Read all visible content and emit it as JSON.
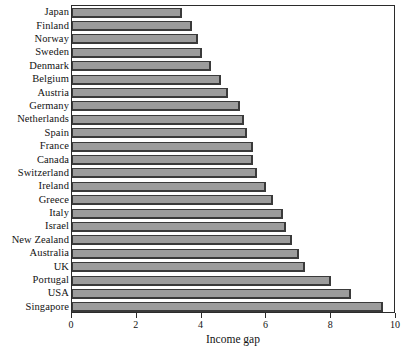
{
  "chart_data": {
    "type": "bar",
    "orientation": "horizontal",
    "title": "",
    "xlabel": "Income gap",
    "ylabel": "",
    "xlim": [
      0,
      10
    ],
    "ylim": null,
    "grid": false,
    "legend": null,
    "xticks": [
      0,
      2,
      4,
      6,
      8,
      10
    ],
    "xtick_labels": [
      "0",
      "2",
      "4",
      "6",
      "8",
      "10"
    ],
    "categories": [
      "Japan",
      "Finland",
      "Norway",
      "Sweden",
      "Denmark",
      "Belgium",
      "Austria",
      "Germany",
      "Netherlands",
      "Spain",
      "France",
      "Canada",
      "Switzerland",
      "Ireland",
      "Greece",
      "Italy",
      "Israel",
      "New Zealand",
      "Australia",
      "UK",
      "Portugal",
      "USA",
      "Singapore"
    ],
    "values": [
      3.4,
      3.7,
      3.9,
      4.0,
      4.3,
      4.6,
      4.8,
      5.2,
      5.3,
      5.4,
      5.6,
      5.6,
      5.7,
      6.0,
      6.2,
      6.5,
      6.6,
      6.8,
      7.0,
      7.2,
      8.0,
      8.6,
      9.6
    ],
    "series": [
      {
        "name": "Income gap",
        "values": [
          3.4,
          3.7,
          3.9,
          4.0,
          4.3,
          4.6,
          4.8,
          5.2,
          5.3,
          5.4,
          5.6,
          5.6,
          5.7,
          6.0,
          6.2,
          6.5,
          6.6,
          6.8,
          7.0,
          7.2,
          8.0,
          8.6,
          9.6
        ]
      }
    ],
    "colors": {
      "bar_fill": "#9c9c9c",
      "bar_edge": "#3a3a3a",
      "axis": "#2b2b2b",
      "text": "#121212",
      "background": "#ffffff"
    }
  }
}
